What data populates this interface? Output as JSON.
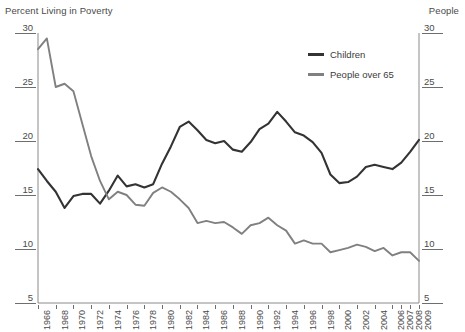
{
  "titles": {
    "left": "Percent Living in Poverty",
    "right": "People"
  },
  "legend": [
    {
      "label": "Children",
      "color": "#333333"
    },
    {
      "label": "People over 65",
      "color": "#808080"
    }
  ],
  "axis": {
    "y_ticks": [
      "30",
      "25",
      "20",
      "15",
      "10",
      "5"
    ],
    "x_ticks": [
      "1966",
      "1968",
      "1970",
      "1972",
      "1974",
      "1976",
      "1978",
      "1980",
      "1982",
      "1984",
      "1986",
      "1988",
      "1990",
      "1992",
      "1994",
      "1996",
      "1998",
      "2000",
      "2002",
      "2004",
      "2006",
      "2007",
      "2008",
      "2009"
    ]
  },
  "chart_data": {
    "type": "line",
    "title": "Percent Living in Poverty",
    "xlabel": "",
    "ylabel": "Percent Living in Poverty",
    "ylabel_right": "People",
    "ylim": [
      5,
      30
    ],
    "grid": false,
    "legend_position": "top-right",
    "x": [
      1966,
      1967,
      1968,
      1969,
      1970,
      1971,
      1972,
      1973,
      1974,
      1975,
      1976,
      1977,
      1978,
      1979,
      1980,
      1981,
      1982,
      1983,
      1984,
      1985,
      1986,
      1987,
      1988,
      1989,
      1990,
      1991,
      1992,
      1993,
      1994,
      1995,
      1996,
      1997,
      1998,
      1999,
      2000,
      2001,
      2002,
      2003,
      2004,
      2005,
      2006,
      2007,
      2008,
      2009
    ],
    "series": [
      {
        "name": "Children",
        "color": "#333333",
        "values": [
          17.4,
          16.3,
          15.3,
          13.8,
          14.9,
          15.1,
          15.1,
          14.2,
          15.4,
          16.8,
          15.8,
          16.0,
          15.7,
          16.0,
          17.9,
          19.5,
          21.3,
          21.8,
          21.0,
          20.1,
          19.8,
          20.0,
          19.2,
          19.0,
          19.9,
          21.1,
          21.6,
          22.7,
          21.8,
          20.8,
          20.5,
          19.9,
          18.9,
          16.9,
          16.1,
          16.2,
          16.7,
          17.6,
          17.8,
          17.6,
          17.4,
          18.0,
          19.0,
          20.1
        ]
      },
      {
        "name": "People over 65",
        "color": "#808080",
        "values": [
          28.5,
          29.5,
          25.0,
          25.3,
          24.6,
          21.6,
          18.6,
          16.3,
          14.6,
          15.3,
          15.0,
          14.1,
          14.0,
          15.2,
          15.7,
          15.3,
          14.6,
          13.8,
          12.4,
          12.6,
          12.4,
          12.5,
          12.0,
          11.4,
          12.2,
          12.4,
          12.9,
          12.2,
          11.7,
          10.5,
          10.8,
          10.5,
          10.5,
          9.7,
          9.9,
          10.1,
          10.4,
          10.2,
          9.8,
          10.1,
          9.4,
          9.7,
          9.7,
          8.9
        ]
      }
    ]
  }
}
